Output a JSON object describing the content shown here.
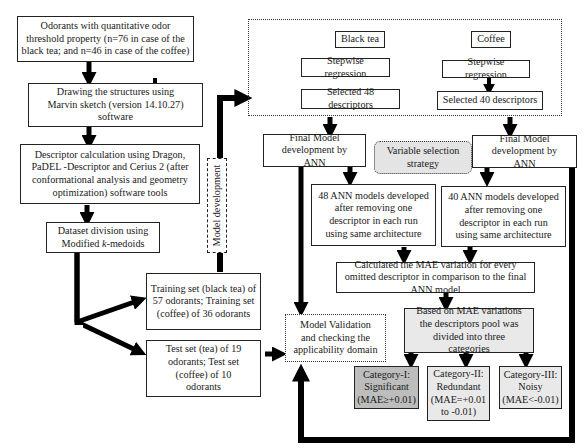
{
  "diagram": {
    "left_column": {
      "odorants": "Odorants with  quantitative odor threshold property (n=76 in case of the black tea; and n=46 in case of the coffee)",
      "drawing": "Drawing the structures using Marvin sketch (version 14.10.27) software",
      "descriptor_calc": "Descriptor calculation using Dragon, PaDEL -Descriptor  and Cerius 2 (after conformational analysis and geometry optimization) software tools",
      "dataset_division_1": "Dataset division using",
      "dataset_division_2": "Modified ",
      "dataset_division_k": "k",
      "dataset_division_3": "-medoids",
      "training_set": "Training set (black tea) of 57 odorants; Training set (coffee) of 36 odorants",
      "test_set": "Test set (tea) of 19 odorants; Test set (coffee) of 10 odorants",
      "model_development_label": "Model development"
    },
    "variable_selection": {
      "black_tea": "Black tea",
      "coffee": "Coffee",
      "stepwise_tea": "Stepwise regression",
      "stepwise_coffee": "Stepwise regression",
      "selected_tea": "Selected 48 descriptors",
      "selected_coffee": "Selected 40 descriptors",
      "strategy": "Variable selection strategy"
    },
    "ann": {
      "final_model_tea": "Final Model development by ANN",
      "final_model_coffee": "Final Model development by ANN",
      "models_tea": "48 ANN models developed after removing one descriptor in each run using same architecture",
      "models_coffee": "40 ANN models developed after removing one descriptor in each run using same architecture",
      "mae_calc": "Calculated the MAE variation for every omitted descriptor in comparison to the final ANN model",
      "categories_intro": "Based on MAE variations the descriptors pool was divided into three categories"
    },
    "validation": "Model Validation and checking the applicability domain",
    "categories": [
      {
        "title": "Category-I:",
        "name": "Significant",
        "rule": "(MAE≥+0.01)"
      },
      {
        "title": "Category-II:",
        "name": "Redundant",
        "rule": "(MAE=+0.01 to -0.01)"
      },
      {
        "title": "Category-III:",
        "name": "Noisy",
        "rule": "(MAE<-0.01)"
      }
    ]
  }
}
